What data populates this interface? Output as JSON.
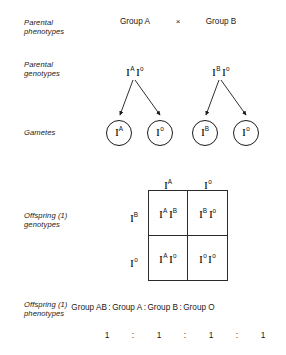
{
  "diagram": {
    "title_row_labels": {
      "parental_phenotypes": "Parental\nphenotypes",
      "parental_genotypes": "Parental\ngenotypes",
      "gametes": "Gametes",
      "offspring_genotypes": "Offspring (1)\ngenotypes",
      "offspring_phenotypes": "Offspring (1)\nphenotypes"
    },
    "parental_phenotypes": {
      "left": "Group A",
      "cross_symbol": "×",
      "right": "Group B"
    },
    "parental_genotypes": {
      "left": [
        {
          "base": "I",
          "sup": "A"
        },
        {
          "base": "I",
          "sup": "o"
        }
      ],
      "right": [
        {
          "base": "I",
          "sup": "B"
        },
        {
          "base": "I",
          "sup": "o"
        }
      ]
    },
    "gametes": [
      {
        "base": "I",
        "sup": "A"
      },
      {
        "base": "I",
        "sup": "o"
      },
      {
        "base": "I",
        "sup": "B"
      },
      {
        "base": "I",
        "sup": "o"
      }
    ],
    "punnett": {
      "column_headers": [
        {
          "base": "I",
          "sup": "A"
        },
        {
          "base": "I",
          "sup": "o"
        }
      ],
      "row_headers": [
        {
          "base": "I",
          "sup": "B"
        },
        {
          "base": "I",
          "sup": "o"
        }
      ],
      "cells": [
        [
          [
            {
              "base": "I",
              "sup": "A"
            },
            {
              "base": "I",
              "sup": "B"
            }
          ],
          [
            {
              "base": "I",
              "sup": "B"
            },
            {
              "base": "I",
              "sup": "o"
            }
          ]
        ],
        [
          [
            {
              "base": "I",
              "sup": "A"
            },
            {
              "base": "I",
              "sup": "o"
            }
          ],
          [
            {
              "base": "I",
              "sup": "o"
            },
            {
              "base": "I",
              "sup": "o"
            }
          ]
        ]
      ]
    },
    "offspring_phenotypes": {
      "groups": [
        "Group AB",
        "Group A",
        "Group B",
        "Group O"
      ],
      "separator": ":",
      "ratio": [
        "1",
        "1",
        "1",
        "1"
      ],
      "ratio_separator": ":"
    },
    "colors": {
      "ink": "#1a1a1a",
      "line": "#2b2b2b",
      "background": "#ffffff"
    }
  }
}
